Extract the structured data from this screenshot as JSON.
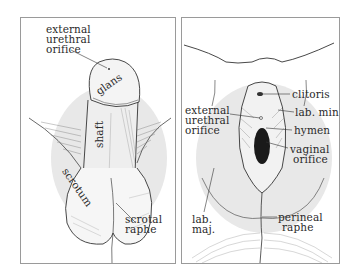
{
  "figure": {
    "panels": [
      {
        "id": "male",
        "labels": {
          "external_urethral_orifice": [
            "external",
            "urethral",
            "orifice"
          ],
          "glans": "glans",
          "shaft": "shaft",
          "scrotum": "scrotum",
          "scrotal_raphe": [
            "scrotal",
            "raphe"
          ]
        }
      },
      {
        "id": "female",
        "labels": {
          "clitoris": "clitoris",
          "external_urethral_orifice": [
            "external",
            "urethral",
            "orifice"
          ],
          "lab_min": "lab. min.",
          "hymen": "hymen",
          "vaginal_orifice": [
            "vaginal",
            "orifice"
          ],
          "lab_maj": [
            "lab.",
            "maj."
          ],
          "perineal_raphe": [
            "perineal",
            "raphe"
          ]
        }
      }
    ],
    "colors": {
      "highlight": "#e6e6e6",
      "line": "#333333",
      "frame": "#9a9a9a"
    }
  }
}
